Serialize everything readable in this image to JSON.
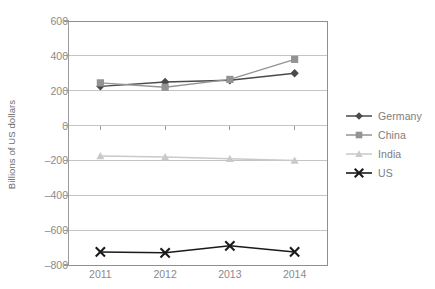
{
  "chart_data": {
    "type": "line",
    "title": "",
    "xlabel": "",
    "ylabel": "Billions of US dollars",
    "categories": [
      "2011",
      "2012",
      "2013",
      "2014"
    ],
    "ylim": [
      -800,
      600
    ],
    "ytick_values": [
      600,
      400,
      200,
      0,
      -200,
      -400,
      -600,
      -800
    ],
    "ytick_labels": [
      "600",
      "400",
      "200",
      "0",
      "–200",
      "–400",
      "–600",
      "–800"
    ],
    "grid": "horizontal",
    "legend_position": "right",
    "series": [
      {
        "name": "Germany",
        "marker": "diamond",
        "color": "#4a4a4a",
        "values": [
          225,
          250,
          260,
          300
        ]
      },
      {
        "name": "China",
        "marker": "square",
        "color": "#939393",
        "values": [
          245,
          220,
          265,
          380
        ]
      },
      {
        "name": "India",
        "marker": "triangle",
        "color": "#c9c9c9",
        "values": [
          -175,
          -180,
          -190,
          -200
        ]
      },
      {
        "name": "US",
        "marker": "cross",
        "color": "#1a1a1a",
        "values": [
          -725,
          -730,
          -690,
          -725
        ]
      }
    ]
  },
  "colors": {
    "axis": "#9a9a9a",
    "gridline": "#c4c4c4",
    "plot_border": "#8f8f8f",
    "tick_text": "#8a8a8a",
    "axis_title_text": "#6e6e6e",
    "legend_text": "#7d7d7d",
    "background": "#ffffff"
  }
}
